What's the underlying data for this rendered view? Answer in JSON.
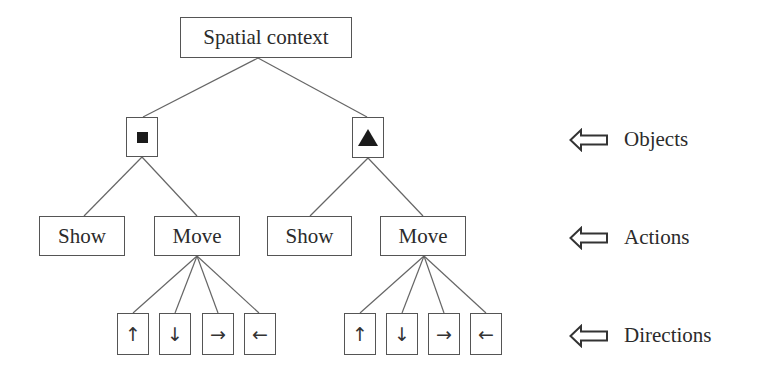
{
  "diagram": {
    "root": {
      "label": "Spatial context"
    },
    "objects": [
      {
        "shape": "square",
        "symbol": "■"
      },
      {
        "shape": "triangle",
        "symbol": "▲"
      }
    ],
    "actions": [
      {
        "label": "Show"
      },
      {
        "label": "Move"
      },
      {
        "label": "Show"
      },
      {
        "label": "Move"
      }
    ],
    "directions_left": [
      {
        "name": "up",
        "glyph": "↑"
      },
      {
        "name": "down",
        "glyph": "↓"
      },
      {
        "name": "right",
        "glyph": "→"
      },
      {
        "name": "left",
        "glyph": "←"
      }
    ],
    "directions_right": [
      {
        "name": "up",
        "glyph": "↑"
      },
      {
        "name": "down",
        "glyph": "↓"
      },
      {
        "name": "right",
        "glyph": "→"
      },
      {
        "name": "left",
        "glyph": "←"
      }
    ],
    "legend": [
      {
        "icon": "hollow-left-arrow-icon",
        "label": "Objects"
      },
      {
        "icon": "hollow-left-arrow-icon",
        "label": "Actions"
      },
      {
        "icon": "hollow-left-arrow-icon",
        "label": "Directions"
      }
    ],
    "colors": {
      "line": "#555555",
      "text": "#2b2b2b",
      "fill": "#1b1b1b",
      "background": "#ffffff"
    }
  }
}
